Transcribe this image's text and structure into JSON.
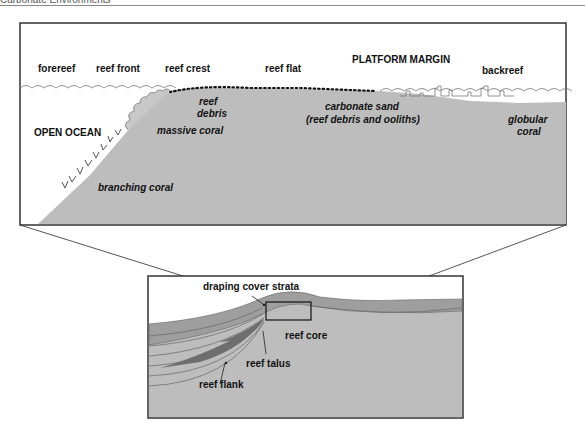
{
  "header": {
    "title": "Carbonate Environments"
  },
  "upper_panel": {
    "zone_labels": {
      "forereef": "forereef",
      "reef_front": "reef front",
      "reef_crest": "reef crest",
      "reef_flat": "reef flat",
      "platform_margin": "PLATFORM MARGIN",
      "backreef": "backreef"
    },
    "feature_labels": {
      "open_ocean": "OPEN OCEAN",
      "reef_debris_1": "reef",
      "reef_debris_2": "debris",
      "massive_coral": "massive coral",
      "branching_coral": "branching coral",
      "carbonate_sand_1": "carbonate sand",
      "carbonate_sand_2": "(reef debris and ooliths)",
      "globular_coral_1": "globular",
      "globular_coral_2": "coral"
    }
  },
  "lower_panel": {
    "labels": {
      "draping_cover_strata": "draping cover strata",
      "reef_core": "reef core",
      "reef_talus": "reef talus",
      "reef_flank": "reef flank"
    }
  },
  "colors": {
    "sediment": "#bdbdbd",
    "strata": "#9e9e9e",
    "strata_dark": "#6e6e6e",
    "frame": "#333333",
    "text": "#111111"
  }
}
